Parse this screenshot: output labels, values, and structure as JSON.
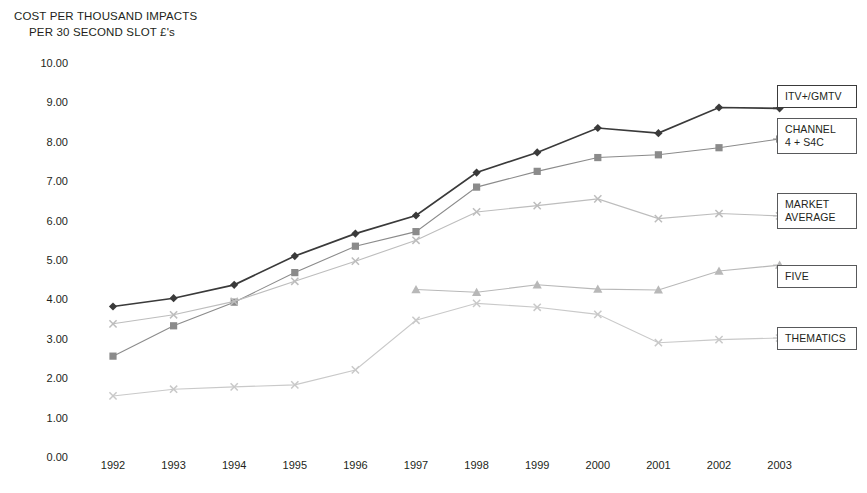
{
  "title": {
    "line1": "COST PER THOUSAND IMPACTS",
    "line2": "PER 30 SECOND SLOT £'s"
  },
  "axes": {
    "y_ticks": [
      "10.00",
      "9.00",
      "8.00",
      "7.00",
      "6.00",
      "5.00",
      "4.00",
      "3.00",
      "2.00",
      "1.00",
      "0.00"
    ],
    "x_ticks": [
      "1992",
      "1993",
      "1994",
      "1995",
      "1996",
      "1997",
      "1998",
      "1999",
      "2000",
      "2001",
      "2002",
      "2003"
    ]
  },
  "legend": [
    {
      "label": "ITV+/GMTV",
      "color": "#3a3a3a"
    },
    {
      "label": "CHANNEL\n4 + S4C",
      "color": "#8b8b8b"
    },
    {
      "label": "MARKET\nAVERAGE",
      "color": "#bdbdbd"
    },
    {
      "label": "FIVE",
      "color": "#b8b8b8"
    },
    {
      "label": "THEMATICS",
      "color": "#c9c9c9"
    }
  ],
  "chart_data": {
    "type": "line",
    "title": "COST PER THOUSAND IMPACTS PER 30 SECOND SLOT £'s",
    "xlabel": "",
    "ylabel": "COST PER THOUSAND IMPACTS PER 30 SECOND SLOT £'s",
    "ylim": [
      0,
      10
    ],
    "ytick_step": 1,
    "grid": false,
    "legend_position": "right-outside",
    "categories": [
      "1992",
      "1993",
      "1994",
      "1995",
      "1996",
      "1997",
      "1998",
      "1999",
      "2000",
      "2001",
      "2002",
      "2003"
    ],
    "series": [
      {
        "name": "ITV+/GMTV",
        "color": "#3a3a3a",
        "marker": "diamond",
        "values": [
          3.82,
          4.03,
          4.37,
          5.1,
          5.67,
          6.13,
          7.22,
          7.73,
          8.35,
          8.22,
          8.87,
          8.85
        ]
      },
      {
        "name": "CHANNEL 4 + S4C",
        "color": "#8b8b8b",
        "marker": "square",
        "values": [
          2.56,
          3.33,
          3.93,
          4.68,
          5.35,
          5.72,
          6.85,
          7.25,
          7.6,
          7.67,
          7.85,
          8.07
        ]
      },
      {
        "name": "MARKET AVERAGE",
        "color": "#bdbdbd",
        "marker": "x",
        "values": [
          3.38,
          3.61,
          3.95,
          4.46,
          4.97,
          5.5,
          6.22,
          6.38,
          6.55,
          6.05,
          6.18,
          6.12
        ]
      },
      {
        "name": "FIVE",
        "color": "#b8b8b8",
        "marker": "triangle",
        "values": [
          null,
          null,
          null,
          null,
          null,
          4.25,
          4.18,
          4.37,
          4.26,
          4.24,
          4.72,
          4.87
        ]
      },
      {
        "name": "THEMATICS",
        "color": "#c9c9c9",
        "marker": "x",
        "values": [
          1.55,
          1.72,
          1.78,
          1.83,
          2.21,
          3.47,
          3.9,
          3.8,
          3.62,
          2.9,
          2.98,
          3.02
        ]
      }
    ]
  },
  "geometry": {
    "x_first": 113,
    "x_step": 60.6,
    "y_zero": 457,
    "y_per_unit": 39.4,
    "legend_tops": [
      85,
      118,
      193,
      265,
      327
    ],
    "legend_left": 777,
    "legend_width": 80
  }
}
